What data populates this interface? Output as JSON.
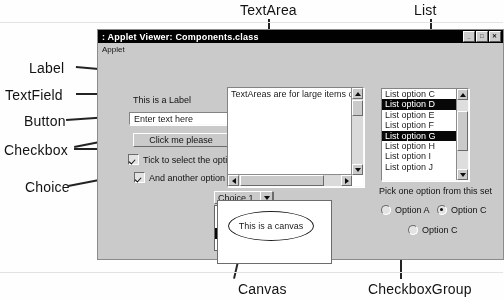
{
  "annotations": {
    "textarea": "TextArea",
    "list": "List",
    "label": "Label",
    "textfield": "TextField",
    "button": "Button",
    "checkbox": "Checkbox",
    "choice": "Choice",
    "canvas": "Canvas",
    "checkboxgroup": "CheckboxGroup"
  },
  "window": {
    "title": ": Applet Viewer:  Components.class",
    "menu": "Applet",
    "buttons": {
      "minimize": "_",
      "maximize": "□",
      "close": "✕"
    }
  },
  "applet": {
    "label_text": "This is a Label",
    "textfield_value": "Enter text here",
    "button_label": "Click me please",
    "checkbox1_label": "Tick to select the option",
    "checkbox2_label": "And another option",
    "choice_selected": "Choice 1",
    "choice_options": [
      {
        "label": "Choice 1",
        "selected": false
      },
      {
        "label": "Choice 2",
        "selected": false
      },
      {
        "label": "Choice 3",
        "selected": true
      },
      {
        "label": "Choice 4",
        "selected": false
      }
    ],
    "textarea_text": "TextAreas are for large items of",
    "list_options": [
      {
        "label": "List option C",
        "selected": false
      },
      {
        "label": "List option D",
        "selected": true
      },
      {
        "label": "List option E",
        "selected": false
      },
      {
        "label": "List option F",
        "selected": false
      },
      {
        "label": "List option G",
        "selected": true
      },
      {
        "label": "List option H",
        "selected": false
      },
      {
        "label": "List option I",
        "selected": false
      },
      {
        "label": "List option J",
        "selected": false
      }
    ],
    "list_hint": "Pick one option from this set",
    "canvas_text": "This is a canvas",
    "radios": [
      {
        "label": "Option A",
        "selected": false
      },
      {
        "label": "Option C",
        "selected": true
      },
      {
        "label": "Option C",
        "selected": false
      }
    ]
  },
  "colors": {
    "face": "#c6c4bf",
    "titlebar": "#0a0a0a",
    "selection": "#101010",
    "page": "#fefefe"
  }
}
